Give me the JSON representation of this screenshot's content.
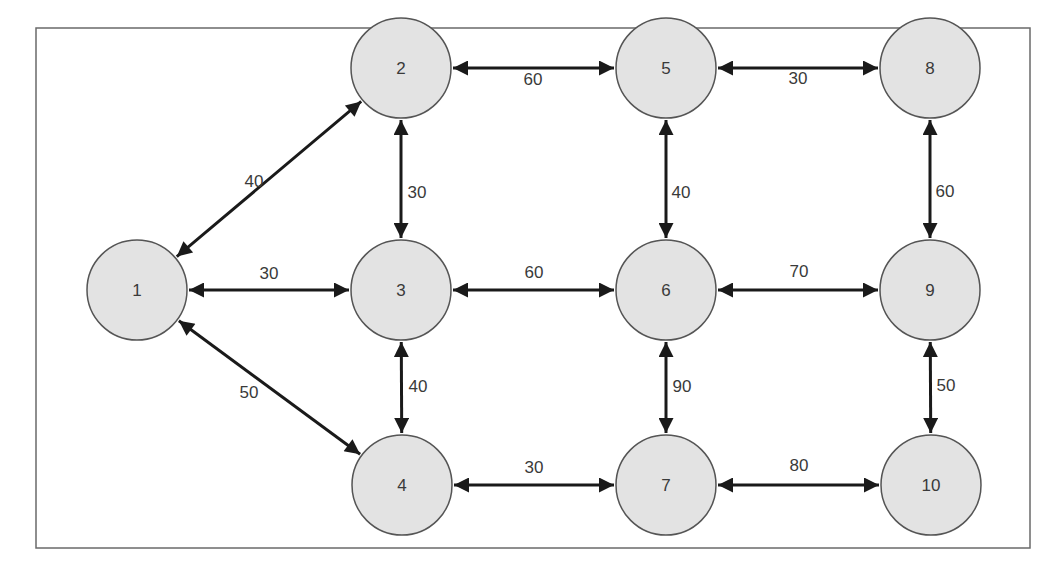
{
  "diagram": {
    "type": "weighted-network",
    "directed": "bidirectional",
    "colors": {
      "node_fill": "#e3e3e3",
      "node_stroke": "#555555",
      "edge": "#1a1a1a",
      "text": "#3a3a3a",
      "frame": "#6a6a6a"
    },
    "frame": {
      "x": 36,
      "y": 28,
      "width": 994,
      "height": 520
    },
    "node_radius": 50,
    "nodes": [
      {
        "id": "1",
        "label": "1",
        "x": 137,
        "y": 290
      },
      {
        "id": "2",
        "label": "2",
        "x": 401,
        "y": 68
      },
      {
        "id": "3",
        "label": "3",
        "x": 401,
        "y": 290
      },
      {
        "id": "4",
        "label": "4",
        "x": 402,
        "y": 485
      },
      {
        "id": "5",
        "label": "5",
        "x": 666,
        "y": 68
      },
      {
        "id": "6",
        "label": "6",
        "x": 666,
        "y": 290
      },
      {
        "id": "7",
        "label": "7",
        "x": 666,
        "y": 485
      },
      {
        "id": "8",
        "label": "8",
        "x": 930,
        "y": 68
      },
      {
        "id": "9",
        "label": "9",
        "x": 930,
        "y": 290
      },
      {
        "id": "10",
        "label": "10",
        "x": 931,
        "y": 485
      }
    ],
    "edges": [
      {
        "from": "1",
        "to": "2",
        "weight": "40",
        "label_pos": [
          254,
          181
        ]
      },
      {
        "from": "1",
        "to": "3",
        "weight": "30",
        "label_pos": [
          269,
          273
        ]
      },
      {
        "from": "1",
        "to": "4",
        "weight": "50",
        "label_pos": [
          249,
          392
        ]
      },
      {
        "from": "2",
        "to": "3",
        "weight": "30",
        "label_pos": [
          417,
          192
        ]
      },
      {
        "from": "3",
        "to": "4",
        "weight": "40",
        "label_pos": [
          418,
          386
        ]
      },
      {
        "from": "2",
        "to": "5",
        "weight": "60",
        "label_pos": [
          533,
          79
        ]
      },
      {
        "from": "3",
        "to": "6",
        "weight": "60",
        "label_pos": [
          534,
          272
        ]
      },
      {
        "from": "4",
        "to": "7",
        "weight": "30",
        "label_pos": [
          534,
          467
        ]
      },
      {
        "from": "5",
        "to": "6",
        "weight": "40",
        "label_pos": [
          681,
          192
        ]
      },
      {
        "from": "6",
        "to": "7",
        "weight": "90",
        "label_pos": [
          682,
          386
        ]
      },
      {
        "from": "5",
        "to": "8",
        "weight": "30",
        "label_pos": [
          798,
          78
        ]
      },
      {
        "from": "6",
        "to": "9",
        "weight": "70",
        "label_pos": [
          799,
          271
        ]
      },
      {
        "from": "7",
        "to": "10",
        "weight": "80",
        "label_pos": [
          799,
          465
        ]
      },
      {
        "from": "8",
        "to": "9",
        "weight": "60",
        "label_pos": [
          945,
          191
        ]
      },
      {
        "from": "9",
        "to": "10",
        "weight": "50",
        "label_pos": [
          946,
          385
        ]
      }
    ]
  }
}
